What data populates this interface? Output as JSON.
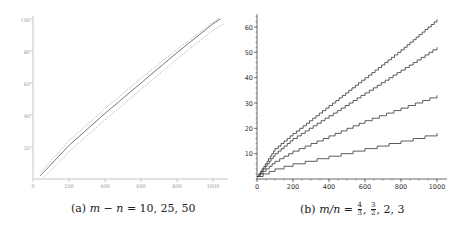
{
  "chart_data": [
    {
      "id": "a",
      "type": "line",
      "caption": {
        "label": "(a)",
        "expr": "m − n = 10, 25, 50"
      },
      "xlabel": "",
      "ylabel": "",
      "xlim": [
        0,
        1050
      ],
      "ylim": [
        0,
        100
      ],
      "xticks": [
        0,
        200,
        400,
        600,
        800,
        1000
      ],
      "yticks": [
        20,
        40,
        60,
        80,
        100
      ],
      "grid": false,
      "legend": null,
      "series": [
        {
          "name": "m-n=10 (upper, dotted)",
          "style": "dotted",
          "x": [
            40,
            200,
            400,
            600,
            800,
            1000,
            1040
          ],
          "y": [
            4,
            24,
            44,
            63,
            81,
            98,
            101
          ]
        },
        {
          "name": "m-n=25 (middle, solid)",
          "style": "solid",
          "x": [
            40,
            200,
            400,
            600,
            800,
            1000,
            1040
          ],
          "y": [
            2,
            21,
            41,
            60,
            79,
            97,
            100
          ]
        },
        {
          "name": "m-n=50 (lower, dotted)",
          "style": "dotted",
          "x": [
            60,
            200,
            400,
            600,
            800,
            1000,
            1060
          ],
          "y": [
            1,
            17,
            37,
            56,
            75,
            93,
            97
          ]
        }
      ]
    },
    {
      "id": "b",
      "type": "line",
      "caption": {
        "label": "(b)",
        "expr_prefix": "m/n =",
        "fractions": [
          {
            "num": "4",
            "den": "3"
          },
          {
            "num": "3",
            "den": "2"
          }
        ],
        "expr_suffix": "2, 3"
      },
      "xlabel": "",
      "ylabel": "",
      "xlim": [
        0,
        1000
      ],
      "ylim": [
        0,
        65
      ],
      "xticks": [
        0,
        200,
        400,
        600,
        800,
        1000
      ],
      "yticks": [
        10,
        20,
        30,
        40,
        50,
        60
      ],
      "grid": false,
      "legend": null,
      "series": [
        {
          "name": "m/n=4/3",
          "style": "staircase",
          "x": [
            0,
            100,
            200,
            400,
            600,
            800,
            1000
          ],
          "y": [
            1,
            12,
            18,
            29,
            40,
            51,
            63
          ]
        },
        {
          "name": "m/n=3/2",
          "style": "staircase",
          "x": [
            0,
            100,
            200,
            400,
            600,
            800,
            1000
          ],
          "y": [
            1,
            10,
            16,
            25,
            34,
            43,
            52
          ]
        },
        {
          "name": "m/n=2",
          "style": "staircase",
          "x": [
            0,
            100,
            200,
            400,
            600,
            800,
            1000
          ],
          "y": [
            1,
            7,
            11,
            17,
            23,
            28,
            33
          ]
        },
        {
          "name": "m/n=3",
          "style": "staircase",
          "x": [
            0,
            100,
            200,
            400,
            600,
            800,
            1000
          ],
          "y": [
            1,
            4,
            6,
            9,
            12,
            15,
            18
          ]
        }
      ]
    }
  ],
  "captions": {
    "a_label": "(a)",
    "a_lhs": "m − n",
    "a_rhs": "= 10, 25, 50",
    "b_label": "(b)",
    "b_lhs": "m/n",
    "b_eq": "=",
    "b_f1_num": "4",
    "b_f1_den": "3",
    "b_f2_num": "3",
    "b_f2_den": "2",
    "b_rest": ", 2, 3"
  }
}
